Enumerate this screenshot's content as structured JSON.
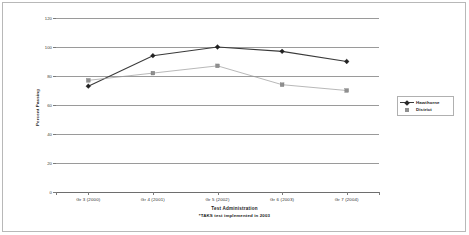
{
  "chart_data": {
    "type": "line",
    "title": "",
    "xlabel": "Test Administration",
    "ylabel": "Percent Passing",
    "footnote": "*TAKS test implemented in 2003",
    "categories": [
      "Gr 3 (2000)",
      "Gr 4 (2001)",
      "Gr 5 (2002)",
      "Gr 6 (2003)",
      "Gr 7 (2004)"
    ],
    "ylim": [
      0,
      120
    ],
    "yticks": [
      0,
      20,
      40,
      60,
      80,
      100,
      120
    ],
    "grid": true,
    "legend_position": "right",
    "series": [
      {
        "name": "Hawthorne",
        "color": "#3a3a3a",
        "marker": "diamond",
        "values": [
          73,
          94,
          100,
          97,
          90
        ]
      },
      {
        "name": "District",
        "color": "#9a9a9a",
        "marker": "square",
        "values": [
          77,
          82,
          87,
          74,
          70
        ]
      }
    ]
  },
  "axis": {
    "y_tick_labels": [
      "120",
      "100",
      "80",
      "60",
      "40",
      "20",
      "0"
    ],
    "y_label": "Percent Passing",
    "x_label": "Test Administration",
    "x_tick_labels": [
      "Gr 3 (2000)",
      "Gr 4 (2001)",
      "Gr 5 (2002)",
      "Gr 6 (2003)",
      "Gr 7 (2004)"
    ]
  },
  "legend": {
    "items": [
      {
        "label": "Hawthorne"
      },
      {
        "label": "District"
      }
    ]
  },
  "notes": {
    "footnote": "*TAKS test implemented in 2003"
  },
  "colors": {
    "hawthorne": "#3a3a3a",
    "district": "#9a9a9a",
    "grid": "#9a9a9a",
    "axis": "#7a7a7a",
    "border": "#b8b8b8"
  }
}
